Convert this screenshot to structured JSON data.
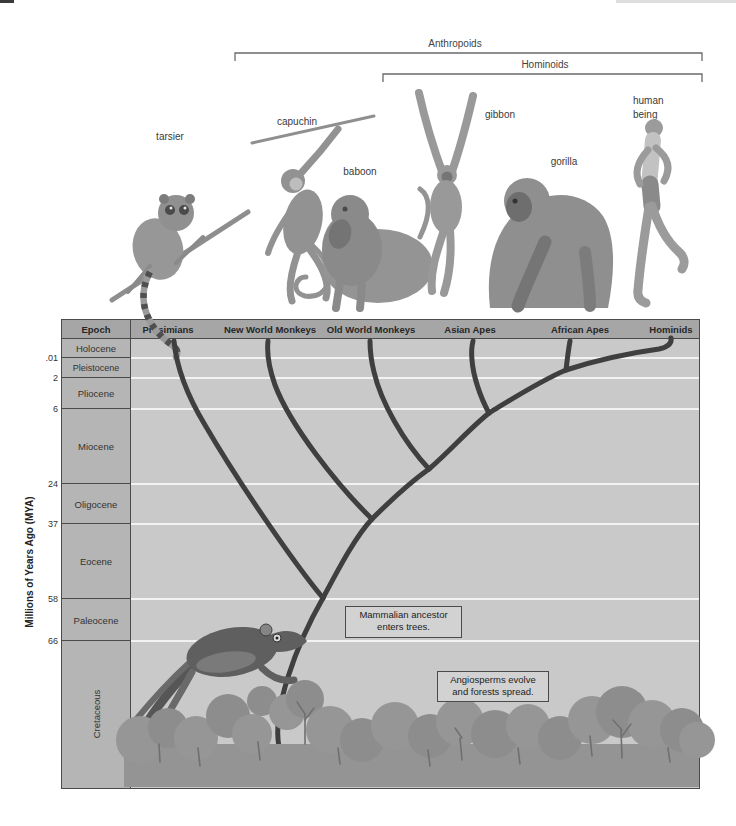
{
  "figure": {
    "brackets": {
      "anthropoids": "Anthropoids",
      "hominoids": "Hominoids"
    },
    "animal_labels": {
      "tarsier": "tarsier",
      "capuchin": "capuchin",
      "baboon": "baboon",
      "gibbon": "gibbon",
      "gorilla": "gorilla",
      "human_line1": "human",
      "human_line2": "being"
    }
  },
  "chart": {
    "header": {
      "columns": [
        "Epoch",
        "Prosimians",
        "New World Monkeys",
        "Old World Monkeys",
        "Asian Apes",
        "African Apes",
        "Hominids"
      ]
    },
    "y_axis": {
      "title": "Millions of Years Ago (MYA)"
    },
    "rows": [
      {
        "name": "Holocene",
        "end_mya": ".01"
      },
      {
        "name": "Pleistocene",
        "end_mya": "2"
      },
      {
        "name": "Pliocene",
        "end_mya": "6"
      },
      {
        "name": "Miocene",
        "end_mya": "24"
      },
      {
        "name": "Oligocene",
        "end_mya": "37"
      },
      {
        "name": "Eocene",
        "end_mya": "58"
      },
      {
        "name": "Paleocene",
        "end_mya": "66"
      },
      {
        "name": "Cretaceous"
      }
    ],
    "annotations": {
      "mammal": {
        "line1": "Mammalian ancestor",
        "line2": "enters trees."
      },
      "angiosperm": {
        "line1": "Angiosperms evolve",
        "line2": "and forests spread."
      }
    },
    "colors": {
      "header_bg": "#a6a6a6",
      "epoch_column_bg": "#b5b5b5",
      "plot_bg": "#c9c9c9",
      "branch": "#3f3f3f",
      "gridline": "#f2f2f2",
      "forest": "#949494"
    }
  }
}
